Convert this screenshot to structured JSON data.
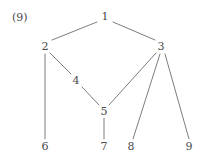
{
  "figure": {
    "index_label": "(9)",
    "index_x": 12,
    "index_y": 17,
    "width": 206,
    "height": 158,
    "background_color": "#ffffff",
    "edge_color": "#6e6e6e",
    "label_color": "#4a4a4a"
  },
  "graph": {
    "type": "tree",
    "node_count": 9,
    "edge_count": 9,
    "nodes": [
      {
        "id": "1",
        "label": "1",
        "x": 105,
        "y": 16
      },
      {
        "id": "2",
        "label": "2",
        "x": 45,
        "y": 46
      },
      {
        "id": "3",
        "label": "3",
        "x": 161,
        "y": 46
      },
      {
        "id": "4",
        "label": "4",
        "x": 76,
        "y": 80
      },
      {
        "id": "5",
        "label": "5",
        "x": 104,
        "y": 111
      },
      {
        "id": "6",
        "label": "6",
        "x": 45,
        "y": 146
      },
      {
        "id": "7",
        "label": "7",
        "x": 104,
        "y": 146
      },
      {
        "id": "8",
        "label": "8",
        "x": 131,
        "y": 146
      },
      {
        "id": "9",
        "label": "9",
        "x": 189,
        "y": 146
      }
    ],
    "edges": [
      {
        "from": "1",
        "to": "2",
        "x1": 97,
        "y1": 22,
        "x2": 52,
        "y2": 40
      },
      {
        "from": "1",
        "to": "3",
        "x1": 113,
        "y1": 22,
        "x2": 155,
        "y2": 40
      },
      {
        "from": "2",
        "to": "4",
        "x1": 50,
        "y1": 53,
        "x2": 71,
        "y2": 74
      },
      {
        "from": "2",
        "to": "6",
        "x1": 45,
        "y1": 54,
        "x2": 45,
        "y2": 139
      },
      {
        "from": "4",
        "to": "5",
        "x1": 82,
        "y1": 87,
        "x2": 99,
        "y2": 105
      },
      {
        "from": "3",
        "to": "5",
        "x1": 156,
        "y1": 53,
        "x2": 109,
        "y2": 105
      },
      {
        "from": "3",
        "to": "8",
        "x1": 160,
        "y1": 54,
        "x2": 133,
        "y2": 139
      },
      {
        "from": "3",
        "to": "9",
        "x1": 165,
        "y1": 54,
        "x2": 189,
        "y2": 139
      },
      {
        "from": "5",
        "to": "7",
        "x1": 104,
        "y1": 118,
        "x2": 104,
        "y2": 139
      }
    ]
  }
}
